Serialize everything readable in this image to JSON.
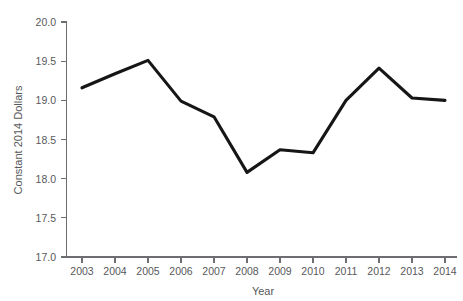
{
  "chart_data": {
    "type": "line",
    "title": "",
    "subtitle": "",
    "xlabel": "Year",
    "ylabel": "Constant 2014 Dollars",
    "categories": [
      "2003",
      "2004",
      "2005",
      "2006",
      "2007",
      "2008",
      "2009",
      "2010",
      "2011",
      "2012",
      "2013",
      "2014"
    ],
    "x": [
      2003,
      2004,
      2005,
      2006,
      2007,
      2008,
      2009,
      2010,
      2011,
      2012,
      2013,
      2014
    ],
    "values": [
      19.16,
      19.34,
      19.51,
      18.99,
      18.79,
      18.08,
      18.37,
      18.33,
      19.0,
      19.41,
      19.03,
      19.0
    ],
    "series": [
      {
        "name": "Constant 2014 Dollars",
        "values": [
          19.16,
          19.34,
          19.51,
          18.99,
          18.79,
          18.08,
          18.37,
          18.33,
          19.0,
          19.41,
          19.03,
          19.0
        ]
      }
    ],
    "ylim": [
      17.0,
      20.0
    ],
    "yticks": [
      17.0,
      17.5,
      18.0,
      18.5,
      19.0,
      19.5,
      20.0
    ],
    "ytick_labels": [
      "17.0",
      "17.5",
      "18.0",
      "18.5",
      "19.0",
      "19.5",
      "20.0"
    ],
    "xtick_labels": [
      "2003",
      "2004",
      "2005",
      "2006",
      "2007",
      "2008",
      "2009",
      "2010",
      "2011",
      "2012",
      "2013",
      "2014"
    ],
    "grid": false,
    "legend": false,
    "legend_position": "none",
    "line_color": "#161616",
    "axis_color": "#6d6e71",
    "text_color": "#58595b",
    "background_color": "#ffffff"
  },
  "axis": {
    "y_title": "Constant 2014 Dollars",
    "x_title": "Year",
    "y_labels": [
      "20.0",
      "19.5",
      "19.0",
      "18.5",
      "18.0",
      "17.5",
      "17.0"
    ],
    "x_labels": [
      "2003",
      "2004",
      "2005",
      "2006",
      "2007",
      "2008",
      "2009",
      "2010",
      "2011",
      "2012",
      "2013",
      "2014"
    ]
  }
}
